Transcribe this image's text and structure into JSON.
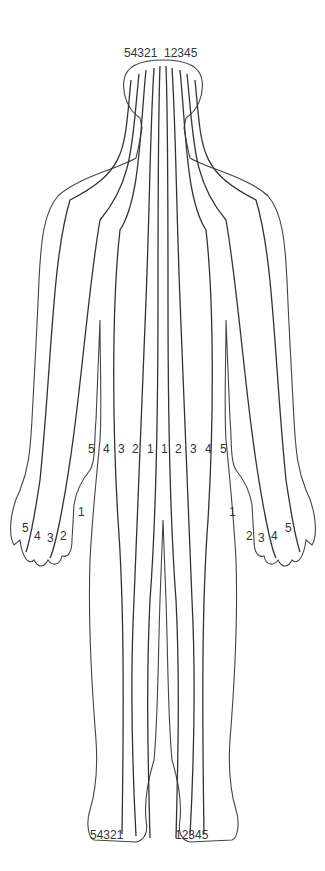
{
  "diagram": {
    "title": "",
    "line_color": "#333333",
    "background": "#ffffff",
    "labels": {
      "head_left": "54321",
      "head_right": "12345",
      "torso": [
        "5",
        "4",
        "3",
        "2",
        "1",
        "1",
        "2",
        "3",
        "4",
        "5"
      ],
      "left_thumb": "1",
      "right_thumb": "1",
      "left_fingers": [
        "5",
        "4",
        "3",
        "2"
      ],
      "right_fingers": [
        "2",
        "3",
        "4",
        "5"
      ],
      "left_foot": "54321",
      "right_foot": "12345"
    }
  }
}
